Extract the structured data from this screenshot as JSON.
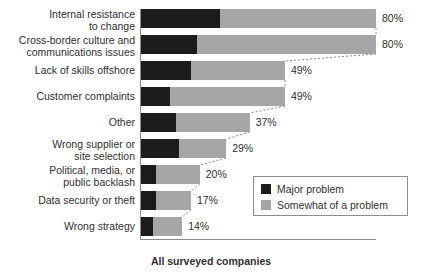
{
  "chart_data": {
    "type": "bar",
    "orientation": "horizontal",
    "stacked": true,
    "title": "",
    "xlabel": "All surveyed companies",
    "ylabel": "",
    "xlim": [
      0,
      80
    ],
    "grid": false,
    "legend_position": "inside-right",
    "categories": [
      "Internal resistance\nto change",
      "Cross-border culture and\ncommunications issues",
      "Lack of skills offshore",
      "Customer complaints",
      "Other",
      "Wrong supplier or\nsite selection",
      "Political, media, or\npublic backlash",
      "Data security or theft",
      "Wrong strategy"
    ],
    "series": [
      {
        "name": "Major problem",
        "color": "#1c1c1c",
        "values": [
          27,
          19,
          17,
          10,
          12,
          13,
          5,
          5,
          4
        ]
      },
      {
        "name": "Somewhat of a problem",
        "color": "#a6a6a6",
        "values": [
          53,
          61,
          32,
          39,
          25,
          16,
          15,
          12,
          10
        ]
      }
    ],
    "totals": [
      80,
      80,
      49,
      49,
      37,
      29,
      20,
      17,
      14
    ],
    "total_labels": [
      "80%",
      "80%",
      "49%",
      "49%",
      "37%",
      "29%",
      "20%",
      "17%",
      "14%"
    ]
  },
  "legend": {
    "items": [
      {
        "label": "Major problem",
        "color": "#1c1c1c"
      },
      {
        "label": "Somewhat of a problem",
        "color": "#a6a6a6"
      }
    ]
  },
  "footer": {
    "title": "All surveyed companies"
  }
}
